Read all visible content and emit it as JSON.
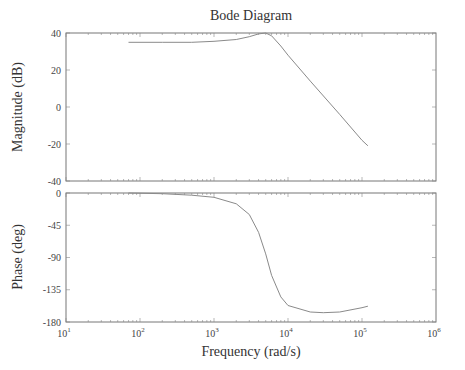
{
  "chart_data": [
    {
      "type": "line",
      "title": "Bode Diagram",
      "panel": "magnitude",
      "xlabel": "Frequency (rad/s)",
      "ylabel": "Magnitude (dB)",
      "xscale": "log",
      "xlim": [
        10,
        1000000
      ],
      "ylim": [
        -40,
        40
      ],
      "yticks": [
        40,
        20,
        0,
        -20,
        -40
      ],
      "grid": false,
      "x": [
        70,
        200,
        500,
        1000,
        2000,
        3000,
        4000,
        5000,
        6000,
        8000,
        10000,
        20000,
        50000,
        100000,
        120000
      ],
      "values": [
        35,
        35,
        35,
        35.5,
        36.5,
        38,
        39.5,
        40,
        38.5,
        33,
        28,
        14,
        -4,
        -18,
        -21
      ]
    },
    {
      "type": "line",
      "panel": "phase",
      "xlabel": "Frequency (rad/s)",
      "ylabel": "Phase (deg)",
      "xscale": "log",
      "xlim": [
        10,
        1000000
      ],
      "ylim": [
        -180,
        0
      ],
      "yticks": [
        0,
        -45,
        -90,
        -135,
        -180
      ],
      "xticks": [
        "10^1",
        "10^2",
        "10^3",
        "10^4",
        "10^5",
        "10^6"
      ],
      "grid": false,
      "x": [
        70,
        200,
        500,
        1000,
        2000,
        3000,
        4000,
        5000,
        6000,
        8000,
        10000,
        20000,
        30000,
        50000,
        100000,
        120000
      ],
      "values": [
        0,
        -1,
        -3,
        -6,
        -15,
        -30,
        -55,
        -85,
        -115,
        -145,
        -157,
        -166,
        -167,
        -166,
        -160,
        -158
      ]
    }
  ],
  "labels": {
    "title": "Bode Diagram",
    "xlabel": "Frequency (rad/s)",
    "ylabel_mag": "Magnitude (dB)",
    "ylabel_phase": "Phase (deg)",
    "mag_ticks": [
      "40",
      "20",
      "0",
      "-20",
      "-40"
    ],
    "phase_ticks": [
      "0",
      "-45",
      "-90",
      "-135",
      "-180"
    ],
    "x_tick_base": "10",
    "x_tick_exps": [
      "1",
      "2",
      "3",
      "4",
      "5",
      "6"
    ]
  },
  "colors": {
    "line": "#8a8a8a",
    "axes": "#777777"
  }
}
